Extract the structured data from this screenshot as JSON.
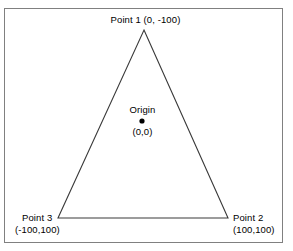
{
  "figure": {
    "type": "geometry-diagram",
    "background_color": "#ffffff",
    "frame_color": "#808080",
    "line_color": "#3a3a3a",
    "text_color": "#000000",
    "labels": {
      "point1": {
        "name": "Point 1",
        "coordinates": "(0, -100)",
        "full": "Point 1 (0, -100)"
      },
      "point2": {
        "name": "Point 2",
        "coordinates": "(100,100)"
      },
      "point3": {
        "name": "Point 3",
        "coordinates": "(-100,100)"
      },
      "origin": {
        "name": "Origin",
        "coordinates": "(0,0)"
      }
    }
  },
  "chart_data": {
    "type": "scatter",
    "title": "",
    "xlabel": "",
    "ylabel": "",
    "coordinate_system": "screen-style, y increases downward",
    "shapes": [
      {
        "shape": "triangle",
        "filled": false,
        "stroke": "#3a3a3a",
        "vertices_logical": [
          [
            0,
            -100
          ],
          [
            100,
            100
          ],
          [
            -100,
            100
          ]
        ],
        "vertices_pixels": [
          [
            144,
            30
          ],
          [
            228,
            218
          ],
          [
            58,
            218
          ]
        ]
      }
    ],
    "points": [
      {
        "label": "Point 1",
        "value": [
          0,
          -100
        ],
        "pixel": [
          144,
          30
        ],
        "marker": "vertex"
      },
      {
        "label": "Point 2",
        "value": [
          100,
          100
        ],
        "pixel": [
          228,
          218
        ],
        "marker": "vertex"
      },
      {
        "label": "Point 3",
        "value": [
          -100,
          100
        ],
        "pixel": [
          58,
          218
        ],
        "marker": "vertex"
      },
      {
        "label": "Origin",
        "value": [
          0,
          0
        ],
        "pixel": [
          142,
          121
        ],
        "marker": "dot"
      }
    ],
    "grid": false,
    "legend": false
  }
}
